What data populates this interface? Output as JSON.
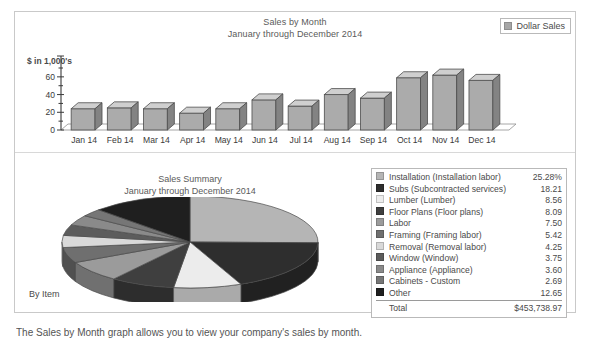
{
  "bar_panel": {
    "title_line1": "Sales by Month",
    "title_line2": "January through December 2014",
    "legend_label": "Dollar Sales",
    "legend_swatch_color": "#a6a6a6",
    "axis_unit": "$ in 1,000's"
  },
  "pie_panel": {
    "title_line1": "Sales Summary",
    "title_line2": "January through December 2014",
    "by_item_label": "By Item"
  },
  "breakdown": {
    "total_label": "Total",
    "total_value": "$453,738.97",
    "rows": [
      {
        "label": "Installation (Installation labor)",
        "value": "25.28%",
        "color": "#b5b5b5"
      },
      {
        "label": "Subs (Subcontracted services)",
        "value": "18.21",
        "color": "#2e2e2e"
      },
      {
        "label": "Lumber (Lumber)",
        "value": "8.56",
        "color": "#ececec"
      },
      {
        "label": "Floor Plans (Floor plans)",
        "value": "8.09",
        "color": "#3f3f3f"
      },
      {
        "label": "Labor",
        "value": "7.50",
        "color": "#9b9b9b"
      },
      {
        "label": "Framing (Framing labor)",
        "value": "5.42",
        "color": "#6f6f6f"
      },
      {
        "label": "Removal (Removal labor)",
        "value": "4.25",
        "color": "#d9d9d9"
      },
      {
        "label": "Window (Window)",
        "value": "3.75",
        "color": "#5c5c5c"
      },
      {
        "label": "Appliance (Appliance)",
        "value": "3.60",
        "color": "#8a8a8a"
      },
      {
        "label": "Cabinets - Custom",
        "value": "2.69",
        "color": "#767676"
      },
      {
        "label": "Other",
        "value": "12.65",
        "color": "#1f1f1f"
      }
    ]
  },
  "footer": {
    "cut_text": "The Sales by Month graph allows you to view your company's sales by month."
  },
  "chart_data": [
    {
      "type": "bar",
      "title": "Sales by Month / January through December 2014",
      "xlabel": "",
      "ylabel": "$ in 1,000's",
      "categories": [
        "Jan 14",
        "Feb 14",
        "Mar 14",
        "Apr 14",
        "May 14",
        "Jun 14",
        "Jul 14",
        "Aug 14",
        "Sep 14",
        "Oct 14",
        "Nov 14",
        "Dec 14"
      ],
      "series": [
        {
          "name": "Dollar Sales",
          "values": [
            24,
            25,
            24,
            19,
            24,
            34,
            27,
            40,
            36,
            59,
            62,
            56
          ]
        }
      ],
      "ylim": [
        0,
        70
      ],
      "yticks": [
        0,
        20,
        40,
        60
      ],
      "yminor_step": 10,
      "grid": false,
      "legend_position": "top-right",
      "style_3d": true
    },
    {
      "type": "pie",
      "title": "Sales Summary / January through December 2014",
      "labels": [
        "Installation (Installation labor)",
        "Subs (Subcontracted services)",
        "Lumber (Lumber)",
        "Floor Plans (Floor plans)",
        "Labor",
        "Framing (Framing labor)",
        "Removal (Removal labor)",
        "Window (Window)",
        "Appliance (Appliance)",
        "Cabinets - Custom",
        "Other"
      ],
      "values": [
        25.28,
        18.21,
        8.56,
        8.09,
        7.5,
        5.42,
        4.25,
        3.75,
        3.6,
        2.69,
        12.65
      ],
      "unit": "percent",
      "total": "$453,738.97",
      "colors": [
        "#b5b5b5",
        "#2e2e2e",
        "#ececec",
        "#3f3f3f",
        "#9b9b9b",
        "#6f6f6f",
        "#d9d9d9",
        "#5c5c5c",
        "#8a8a8a",
        "#767676",
        "#1f1f1f"
      ],
      "style_3d": true,
      "legend_position": "right"
    }
  ]
}
